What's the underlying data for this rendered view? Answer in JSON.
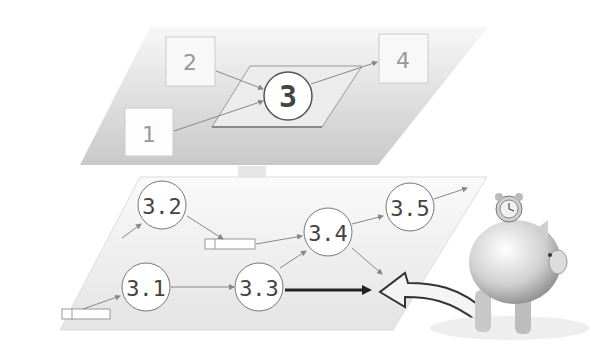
{
  "top_plane": {
    "boxes": [
      {
        "id": "1",
        "label": "1"
      },
      {
        "id": "2",
        "label": "2"
      },
      {
        "id": "4",
        "label": "4"
      }
    ],
    "center_node": {
      "label": "3"
    }
  },
  "bottom_plane": {
    "nodes": [
      {
        "id": "3.1",
        "label": "3.1"
      },
      {
        "id": "3.2",
        "label": "3.2"
      },
      {
        "id": "3.3",
        "label": "3.3"
      },
      {
        "id": "3.4",
        "label": "3.4"
      },
      {
        "id": "3.5",
        "label": "3.5"
      }
    ]
  },
  "illustration": {
    "name": "piggy-bank-with-clock"
  },
  "colors": {
    "plane_fill": "#d8d8d8",
    "line": "#888888",
    "node_text": "#444444"
  }
}
